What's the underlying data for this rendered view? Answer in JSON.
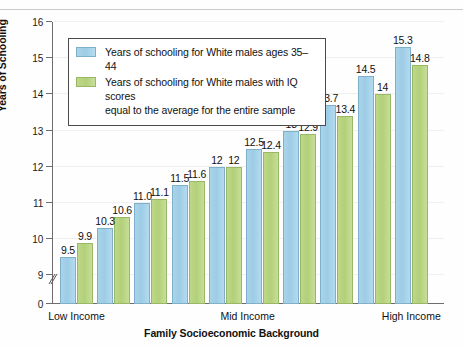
{
  "chart_data": {
    "type": "bar",
    "title": "",
    "xlabel": "Family Socioeconomic Background",
    "ylabel": "Years of Schooling",
    "ylim": [
      8.6,
      16
    ],
    "yticks": [
      "0",
      "9",
      "10",
      "11",
      "12",
      "13",
      "14",
      "15",
      "16"
    ],
    "axis_break": true,
    "grid": true,
    "legend_position": "upper-left-inside",
    "categories": [
      "1",
      "2",
      "3",
      "4",
      "5",
      "6",
      "7",
      "8",
      "9",
      "10"
    ],
    "category_labels": [
      "Low Income",
      "Mid Income",
      "High Income"
    ],
    "series": [
      {
        "name": "Years of schooling for White males ages 35–44",
        "color": "#9ecce6",
        "values": [
          9.5,
          10.3,
          11.0,
          11.5,
          12,
          12.5,
          13,
          13.7,
          14.5,
          15.3
        ],
        "labels": [
          "9.5",
          "10.3",
          "11.0",
          "11.5",
          "12",
          "12.5",
          "13",
          "13.7",
          "14.5",
          "15.3"
        ]
      },
      {
        "name": "Years of schooling for White males with IQ scores equal to the average for the entire sample",
        "color": "#b2d078",
        "values": [
          9.9,
          10.6,
          11.1,
          11.6,
          12,
          12.4,
          12.9,
          13.4,
          14,
          14.8
        ],
        "labels": [
          "9.9",
          "10.6",
          "11.1",
          "11.6",
          "12",
          "12.4",
          "12.9",
          "13.4",
          "14",
          "14.8"
        ]
      }
    ]
  },
  "legend": {
    "items": [
      {
        "swatch": "blue",
        "line1": "Years of schooling for White males ages 35–44",
        "line2": ""
      },
      {
        "swatch": "green",
        "line1": "Years of schooling for White males with IQ scores",
        "line2": "equal to the average for the entire sample"
      }
    ]
  },
  "axes": {
    "y_title": "Years of Schooling",
    "x_title": "Family Socioeconomic Background",
    "y_tick_labels": [
      "16",
      "15",
      "14",
      "13",
      "12",
      "11",
      "10",
      "9",
      "0"
    ],
    "x_tick_labels": [
      "Low Income",
      "Mid Income",
      "High Income"
    ]
  }
}
